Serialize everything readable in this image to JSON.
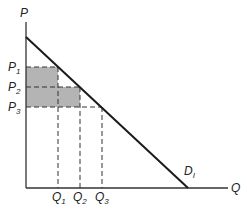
{
  "diagram": {
    "type": "demand-curve",
    "axes": {
      "y_label": "P",
      "x_label": "Q"
    },
    "curve": {
      "label": "D",
      "subscript": "I"
    },
    "price_levels": [
      {
        "label": "P",
        "sub": "1"
      },
      {
        "label": "P",
        "sub": "2"
      },
      {
        "label": "P",
        "sub": "3"
      }
    ],
    "quantity_levels": [
      {
        "label": "Q",
        "sub": "1"
      },
      {
        "label": "Q",
        "sub": "2"
      },
      {
        "label": "Q",
        "sub": "3"
      }
    ],
    "colors": {
      "line": "#1a1a1a",
      "shade": "#b4b4b4",
      "dash": "#333333"
    }
  }
}
